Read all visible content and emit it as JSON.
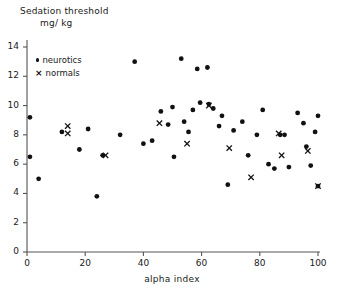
{
  "figure": {
    "title_line1": "Sedation threshold",
    "title_line2": "mg/ kg",
    "xlabel": "alpha index"
  },
  "legend": {
    "position": "upper-left-inside",
    "entries": [
      {
        "marker": "filled-circle",
        "label": "neurotics"
      },
      {
        "marker": "cross",
        "label": "normals"
      }
    ],
    "neurotics_label": "neurotics",
    "normals_label": "normals"
  },
  "axes": {
    "x_ticks": [
      "0",
      "20",
      "40",
      "60",
      "80",
      "100"
    ],
    "y_ticks": [
      "0",
      "2",
      "4",
      "6",
      "8",
      "10",
      "12",
      "14"
    ]
  },
  "colors": {
    "marker": "#111111",
    "axis": "#555555",
    "background": "#ffffff",
    "text": "#1a1a1a"
  },
  "chart_data": {
    "type": "scatter",
    "title": "Sedation threshold mg/ kg",
    "xlabel": "alpha index",
    "ylabel": "Sedation threshold mg/ kg",
    "xlim": [
      0,
      100
    ],
    "ylim": [
      0,
      14
    ],
    "xticks": [
      0,
      20,
      40,
      60,
      80,
      100
    ],
    "yticks": [
      0,
      2,
      4,
      6,
      8,
      10,
      12,
      14
    ],
    "grid": false,
    "series": [
      {
        "name": "neurotics",
        "marker": "filled-circle",
        "color": "#111111",
        "points": [
          [
            1.0,
            9.2
          ],
          [
            1.0,
            6.5
          ],
          [
            4.0,
            5.0
          ],
          [
            12.0,
            8.2
          ],
          [
            18.0,
            7.0
          ],
          [
            21.0,
            8.4
          ],
          [
            24.0,
            3.8
          ],
          [
            26.0,
            6.6
          ],
          [
            32.0,
            8.0
          ],
          [
            37.0,
            13.0
          ],
          [
            40.0,
            7.4
          ],
          [
            43.0,
            7.6
          ],
          [
            46.0,
            9.6
          ],
          [
            48.5,
            8.7
          ],
          [
            50.0,
            9.9
          ],
          [
            50.5,
            6.5
          ],
          [
            53.0,
            13.2
          ],
          [
            54.0,
            8.9
          ],
          [
            55.5,
            8.2
          ],
          [
            57.0,
            9.7
          ],
          [
            58.5,
            12.5
          ],
          [
            59.5,
            10.2
          ],
          [
            62.0,
            12.6
          ],
          [
            62.5,
            10.1
          ],
          [
            64.0,
            9.8
          ],
          [
            66.0,
            8.6
          ],
          [
            67.0,
            9.3
          ],
          [
            69.0,
            4.6
          ],
          [
            71.0,
            8.3
          ],
          [
            74.0,
            8.9
          ],
          [
            76.0,
            6.6
          ],
          [
            79.0,
            8.0
          ],
          [
            81.0,
            9.7
          ],
          [
            83.0,
            6.0
          ],
          [
            85.0,
            5.7
          ],
          [
            87.0,
            8.0
          ],
          [
            88.5,
            8.0
          ],
          [
            90.0,
            5.8
          ],
          [
            93.0,
            9.5
          ],
          [
            95.0,
            8.8
          ],
          [
            96.0,
            7.2
          ],
          [
            97.5,
            5.9
          ],
          [
            99.0,
            8.2
          ],
          [
            100.0,
            9.3
          ],
          [
            100.0,
            4.5
          ]
        ]
      },
      {
        "name": "normals",
        "marker": "cross",
        "color": "#111111",
        "points": [
          [
            14.0,
            8.6
          ],
          [
            14.0,
            8.1
          ],
          [
            27.0,
            6.6
          ],
          [
            45.5,
            8.8
          ],
          [
            55.0,
            7.4
          ],
          [
            62.5,
            10.0
          ],
          [
            69.5,
            7.1
          ],
          [
            77.0,
            5.1
          ],
          [
            86.5,
            8.1
          ],
          [
            87.5,
            6.6
          ],
          [
            96.5,
            6.9
          ],
          [
            100.0,
            4.5
          ]
        ]
      }
    ]
  },
  "geometry": {
    "plot_left": 27,
    "plot_right": 318,
    "plot_bottom": 252,
    "y_top_px": 47,
    "y_top_value": 14
  }
}
